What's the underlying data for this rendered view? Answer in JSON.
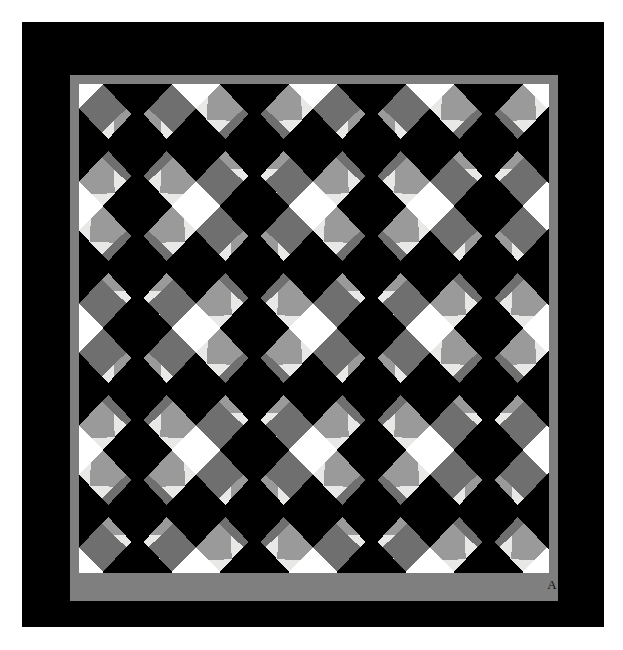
{
  "artwork": {
    "kind": "quilt-photograph",
    "title": "Lattice / Garden Maze diamond quilt",
    "signature_label": "A",
    "page_background": "#ffffff",
    "field_background": "#000000",
    "sashing_color": "#7f7f7f",
    "ground_color": "#000000",
    "triangle_light_color": "#e8e8e6",
    "triangle_mid_color": "#9a9a9a",
    "triangle_dark_color": "#6f6f6f",
    "square_color": "#ffffff"
  },
  "layout": {
    "page_width": 623,
    "page_height": 650,
    "field": {
      "x": 22,
      "y": 22,
      "w": 582,
      "h": 605
    },
    "frame": {
      "x": 48,
      "y": 53,
      "w": 488,
      "h": 526
    },
    "frame_border_width": 9,
    "quilt": {
      "x": 57,
      "y": 62,
      "w": 470,
      "h": 489
    }
  },
  "chart_data": {
    "type": "heatmap",
    "grid_columns": 4,
    "grid_rows": 4,
    "cell_width": 117,
    "cell_height": 122,
    "band_half_width": 17,
    "legend": [
      {
        "name": "ground",
        "color": "#000000",
        "role": "black diamond centers and background"
      },
      {
        "name": "light-triangle",
        "color": "#e8e8e6",
        "role": "pale sawtooth triangles"
      },
      {
        "name": "mid-triangle",
        "color": "#9a9a9a",
        "role": "medium gray sawtooth triangles"
      },
      {
        "name": "dark-triangle",
        "color": "#6f6f6f",
        "role": "darker gray shading triangles"
      },
      {
        "name": "corner-square",
        "color": "#ffffff",
        "role": "white squares at lattice crossings"
      },
      {
        "name": "sashing",
        "color": "#7f7f7f",
        "role": "gray border frame"
      }
    ]
  },
  "signature": {
    "text": "A",
    "position": "bottom sashing, right of center"
  }
}
